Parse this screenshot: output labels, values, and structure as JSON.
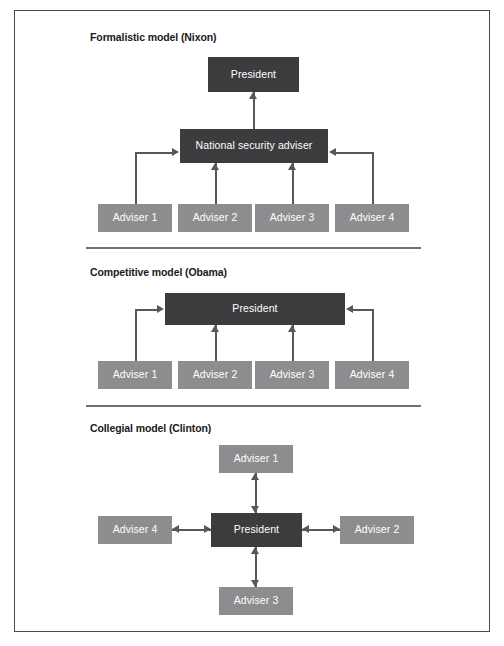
{
  "diagram": {
    "panels": [
      {
        "id": "formalistic",
        "title": "Formalistic model (Nixon)",
        "nodes": {
          "president": "President",
          "nsa": "National security adviser",
          "advisers": [
            "Adviser 1",
            "Adviser 2",
            "Adviser 3",
            "Adviser 4"
          ]
        }
      },
      {
        "id": "competitive",
        "title": "Competitive model (Obama)",
        "nodes": {
          "president": "President",
          "advisers": [
            "Adviser 1",
            "Adviser 2",
            "Adviser 3",
            "Adviser 4"
          ]
        }
      },
      {
        "id": "collegial",
        "title": "Collegial model (Clinton)",
        "nodes": {
          "president": "President",
          "adviser_top": "Adviser 1",
          "adviser_right": "Adviser 2",
          "adviser_bottom": "Adviser 3",
          "adviser_left": "Adviser 4"
        }
      }
    ],
    "colors": {
      "node_dark": "#3c3c3e",
      "node_mid": "#8d8d90",
      "connector": "#58585c",
      "frame": "#4a4a52",
      "divider": "#6f6f76",
      "node_text": "#ffffff",
      "title_text": "#1a1a1a",
      "background": "#ffffff"
    }
  }
}
